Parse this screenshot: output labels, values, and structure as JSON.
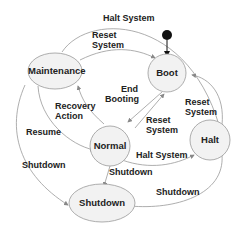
{
  "diagram": {
    "type": "state-machine",
    "initial_state": "Boot",
    "states": [
      {
        "id": "boot",
        "label": "Boot"
      },
      {
        "id": "maintenance",
        "label": "Maintenance"
      },
      {
        "id": "normal",
        "label": "Normal"
      },
      {
        "id": "halt",
        "label": "Halt"
      },
      {
        "id": "shutdown",
        "label": "Shutdown"
      }
    ],
    "transitions": [
      {
        "from": "Maintenance",
        "to": "Halt",
        "label": "Halt System"
      },
      {
        "from": "Maintenance",
        "to": "Boot",
        "label": "Reset System"
      },
      {
        "from": "Boot",
        "to": "Normal",
        "label": "End Booting"
      },
      {
        "from": "Normal",
        "to": "Boot",
        "label": "Reset System"
      },
      {
        "from": "Halt",
        "to": "Boot",
        "label": "Reset System"
      },
      {
        "from": "Normal",
        "to": "Maintenance",
        "label": "Recovery Action"
      },
      {
        "from": "Maintenance",
        "to": "Normal",
        "label": "Resume"
      },
      {
        "from": "Normal",
        "to": "Halt",
        "label": "Halt System"
      },
      {
        "from": "Normal",
        "to": "Shutdown",
        "label": "Shutdown"
      },
      {
        "from": "Maintenance",
        "to": "Shutdown",
        "label": "Shutdown"
      },
      {
        "from": "Halt",
        "to": "Shutdown",
        "label": "Shutdown"
      }
    ],
    "labels": {
      "halt_top": "Halt System",
      "reset_top_1": "Reset",
      "reset_top_2": "System",
      "end_1": "End",
      "end_2": "Booting",
      "recovery_1": "Recovery",
      "recovery_2": "Action",
      "reset_mid_1": "Reset",
      "reset_mid_2": "System",
      "reset_right_1": "Reset",
      "reset_right_2": "System",
      "resume": "Resume",
      "halt_mid": "Halt System",
      "shutdown_left": "Shutdown",
      "shutdown_mid": "Shutdown",
      "shutdown_right": "Shutdown"
    }
  }
}
